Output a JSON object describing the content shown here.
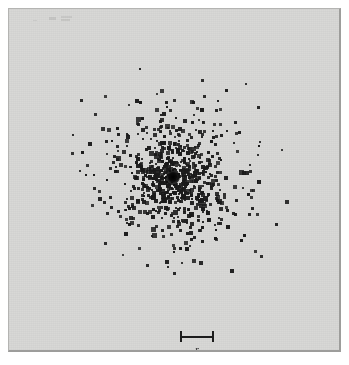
{
  "figure": {
    "type": "scatter",
    "background_color": "#d7d7d5",
    "point_color": "#1a1a1a",
    "outside_color": "#ffffff",
    "border_color": "#9d9d9b"
  },
  "scale_bar": {
    "label": "r",
    "icon": "i-beam-scale-bar",
    "bar_color": "#1c1c1c",
    "length_px": 34
  },
  "annotations": {
    "core_blob": "dense-unresolved-core",
    "plate_artifact": "scan-smudge"
  },
  "chart_data": {
    "type": "scatter",
    "title": "",
    "subtitle": "",
    "xlabel": "",
    "ylabel": "",
    "grid": false,
    "legend": null,
    "axes_visible": false,
    "tick_labels": [],
    "annotations": [
      {
        "name": "scale-bar",
        "text": "r",
        "x": 188,
        "y": 334
      }
    ],
    "center": {
      "x": 172,
      "y": 176
    },
    "xlim": [
      8,
      341
    ],
    "ylim": [
      8,
      352
    ],
    "radial_profile": {
      "model": "projected-King-like surface density",
      "core_radius_px": 26,
      "tidal_radius_px": 150,
      "central_blob_radius_px": 6,
      "n_points": 760,
      "point_size_px_range": [
        2,
        4
      ]
    },
    "series": [
      {
        "name": "points",
        "marker": "square-dot",
        "color": "#1a1a1a",
        "note": "approximately 760 plotted points, surface density falling off with radius from the centre"
      }
    ]
  }
}
